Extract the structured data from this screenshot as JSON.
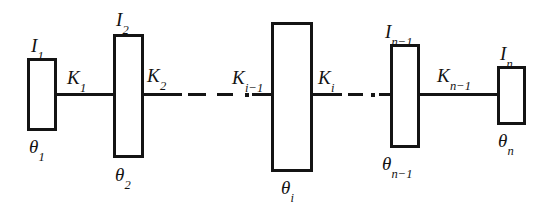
{
  "figure": {
    "background_color": "#ffffff",
    "line_color": "#141414",
    "width": 556,
    "height": 208
  },
  "inertias": [
    {
      "id": "I1",
      "symbol": "I",
      "subscript": "1",
      "label": "I1"
    },
    {
      "id": "I2",
      "symbol": "I",
      "subscript": "2",
      "label": "I2"
    },
    {
      "id": "Ii",
      "symbol": "I",
      "subscript": "i",
      "label": "Ii"
    },
    {
      "id": "In-1",
      "symbol": "I",
      "subscript": "n-1",
      "label": "In-1"
    },
    {
      "id": "In",
      "symbol": "I",
      "subscript": "n",
      "label": "In"
    }
  ],
  "stiffnesses": [
    {
      "id": "K1",
      "symbol": "K",
      "subscript": "1",
      "label": "K1"
    },
    {
      "id": "K2",
      "symbol": "K",
      "subscript": "2",
      "label": "K2"
    },
    {
      "id": "Ki-1",
      "symbol": "K",
      "subscript": "i-1",
      "label": "Ki-1"
    },
    {
      "id": "Ki",
      "symbol": "K",
      "subscript": "i",
      "label": "Ki"
    },
    {
      "id": "Kn-1",
      "symbol": "K",
      "subscript": "n-1",
      "label": "Kn-1"
    }
  ],
  "angles": [
    {
      "id": "th1",
      "symbol": "θ",
      "subscript": "1",
      "label": "theta1"
    },
    {
      "id": "th2",
      "symbol": "θ",
      "subscript": "2",
      "label": "theta2"
    },
    {
      "id": "thi",
      "symbol": "θ",
      "subscript": "i",
      "label": "thetai"
    },
    {
      "id": "thn-1",
      "symbol": "θ",
      "subscript": "n-1",
      "label": "thetan-1"
    },
    {
      "id": "thn",
      "symbol": "θ",
      "subscript": "n",
      "label": "thetan"
    }
  ],
  "labels": {
    "I1": {
      "base": "I",
      "sub": "1"
    },
    "I2": {
      "base": "I",
      "sub": "2"
    },
    "Ii": {
      "base": "I",
      "sub": "i"
    },
    "In1": {
      "base": "I",
      "sub": "n−1"
    },
    "In": {
      "base": "I",
      "sub": "n"
    },
    "K1": {
      "base": "K",
      "sub": "1"
    },
    "K2": {
      "base": "K",
      "sub": "2"
    },
    "Ki1": {
      "base": "K",
      "sub": "i−1"
    },
    "Ki": {
      "base": "K",
      "sub": "i"
    },
    "Kn1": {
      "base": "K",
      "sub": "n−1"
    },
    "th1": {
      "base": "θ",
      "sub": "1"
    },
    "th2": {
      "base": "θ",
      "sub": "2"
    },
    "thi": {
      "base": "θ",
      "sub": "i"
    },
    "thn1": {
      "base": "θ",
      "sub": "n−1"
    },
    "thn": {
      "base": "θ",
      "sub": "n"
    }
  }
}
